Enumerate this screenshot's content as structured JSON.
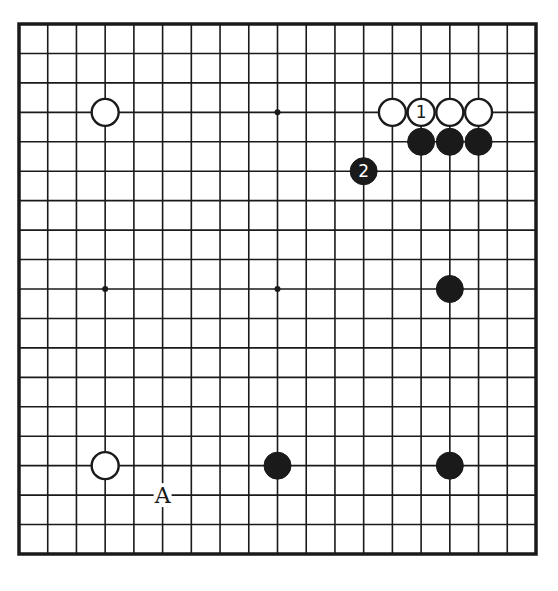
{
  "diagram": {
    "type": "go-board",
    "size": 19,
    "board": {
      "left": 19,
      "top": 24,
      "right": 536,
      "bottom": 554,
      "line_color": "#1a1a1a",
      "background": "#ffffff"
    },
    "star_points": [
      [
        3,
        3
      ],
      [
        9,
        3
      ],
      [
        15,
        3
      ],
      [
        3,
        9
      ],
      [
        9,
        9
      ],
      [
        15,
        9
      ],
      [
        3,
        15
      ],
      [
        9,
        15
      ],
      [
        15,
        15
      ]
    ],
    "stones": [
      {
        "color": "white",
        "col": 3,
        "row": 3,
        "label": ""
      },
      {
        "color": "white",
        "col": 13,
        "row": 3,
        "label": ""
      },
      {
        "color": "white",
        "col": 14,
        "row": 3,
        "label": "1"
      },
      {
        "color": "white",
        "col": 15,
        "row": 3,
        "label": ""
      },
      {
        "color": "white",
        "col": 16,
        "row": 3,
        "label": ""
      },
      {
        "color": "black",
        "col": 14,
        "row": 4,
        "label": ""
      },
      {
        "color": "black",
        "col": 15,
        "row": 4,
        "label": ""
      },
      {
        "color": "black",
        "col": 16,
        "row": 4,
        "label": ""
      },
      {
        "color": "black",
        "col": 12,
        "row": 5,
        "label": "2"
      },
      {
        "color": "black",
        "col": 15,
        "row": 9,
        "label": ""
      },
      {
        "color": "white",
        "col": 3,
        "row": 15,
        "label": ""
      },
      {
        "color": "black",
        "col": 9,
        "row": 15,
        "label": ""
      },
      {
        "color": "black",
        "col": 15,
        "row": 15,
        "label": ""
      }
    ],
    "markers": [
      {
        "col": 5,
        "row": 16,
        "text": "A"
      }
    ],
    "colors": {
      "black_stone": "#1a1a1a",
      "white_stone": "#ffffff",
      "stone_outline": "#1a1a1a"
    }
  }
}
